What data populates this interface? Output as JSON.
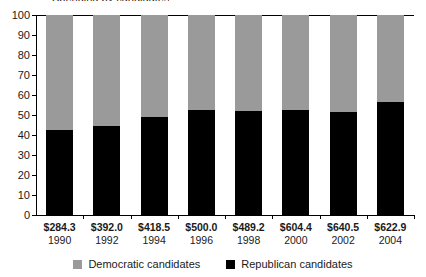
{
  "title_clipped": "Spending by candidates",
  "chart_data": {
    "type": "bar",
    "stacked": true,
    "normalized_percent": true,
    "title": "",
    "xlabel": "",
    "ylabel": "",
    "ylim": [
      0,
      100
    ],
    "yticks": [
      0,
      10,
      20,
      30,
      40,
      50,
      60,
      70,
      80,
      90,
      100
    ],
    "ytick_labels": [
      "0",
      "10",
      "20",
      "30",
      "40",
      "50",
      "60",
      "70",
      "80",
      "90",
      "100"
    ],
    "grid": false,
    "legend_position": "bottom",
    "categories": [
      "1990",
      "1992",
      "1994",
      "1996",
      "1998",
      "2000",
      "2002",
      "2004"
    ],
    "category_amounts": [
      "$284.3",
      "$392.0",
      "$418.5",
      "$500.0",
      "$489.2",
      "$604.4",
      "$640.5",
      "$622.9"
    ],
    "series": [
      {
        "name": "Democratic candidates",
        "color": "#9a9a9a",
        "values": [
          57.5,
          55.5,
          51.0,
          47.5,
          48.0,
          47.5,
          48.5,
          43.5
        ]
      },
      {
        "name": "Republican candidates",
        "color": "#000000",
        "values": [
          42.5,
          44.5,
          49.0,
          52.5,
          52.0,
          52.5,
          51.5,
          56.5
        ]
      }
    ]
  },
  "legend": {
    "items": [
      {
        "label": "Democratic candidates",
        "swatch": "#9a9a9a"
      },
      {
        "label": "Republican candidates",
        "swatch": "#000000"
      }
    ]
  }
}
